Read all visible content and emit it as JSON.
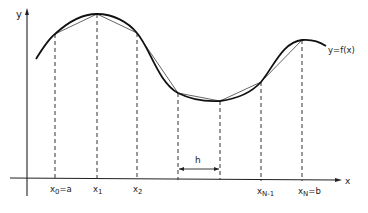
{
  "figure": {
    "axis_x_label": "x",
    "axis_y_label": "y",
    "curve_label": "y=f(x)",
    "step_label": "h",
    "tick_labels": {
      "x0": {
        "main": "x",
        "sub": "0",
        "suffix": "=a"
      },
      "x1": {
        "main": "x",
        "sub": "1",
        "suffix": ""
      },
      "x2": {
        "main": "x",
        "sub": "2",
        "suffix": ""
      },
      "xN1": {
        "main": "x",
        "sub": "N-1",
        "suffix": ""
      },
      "xN": {
        "main": "x",
        "sub": "N",
        "suffix": "=b"
      }
    },
    "colors": {
      "curve": "#1a1a1a",
      "chords": "#555555",
      "axes": "#222222",
      "background": "#ffffff"
    }
  }
}
